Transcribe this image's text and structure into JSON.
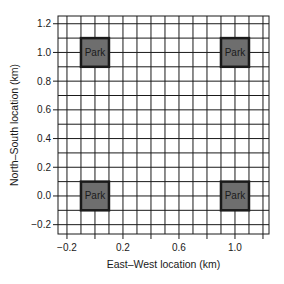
{
  "chart_data": {
    "type": "scatter",
    "title": "",
    "xlabel": "East–West location (km)",
    "ylabel": "North–South location (km)",
    "xlim": [
      -0.264,
      1.243
    ],
    "ylim": [
      -0.265,
      1.254
    ],
    "x_ticks": [
      -0.2,
      0.0,
      0.2,
      0.4,
      0.6,
      0.8,
      1.0,
      1.2
    ],
    "x_tick_labels": [
      "-0.2",
      "",
      "0.2",
      "",
      "0.6",
      "",
      "1.0",
      ""
    ],
    "y_ticks": [
      -0.2,
      0.0,
      0.2,
      0.4,
      0.6,
      0.8,
      1.0,
      1.2
    ],
    "y_tick_labels": [
      "-0.2",
      "0.0",
      "0.2",
      "0.4",
      "0.6",
      "0.8",
      "1.0",
      "1.2"
    ],
    "grid": {
      "on": true,
      "spacing_km": 0.1,
      "color": "#1a1a1a"
    },
    "legend": null,
    "parks": [
      {
        "label": "Park",
        "x": 0.0,
        "y": 1.0,
        "half_size_km": 0.1
      },
      {
        "label": "Park",
        "x": 1.0,
        "y": 1.0,
        "half_size_km": 0.1
      },
      {
        "label": "Park",
        "x": 0.0,
        "y": 0.0,
        "half_size_km": 0.1
      },
      {
        "label": "Park",
        "x": 1.0,
        "y": 0.0,
        "half_size_km": 0.1
      }
    ],
    "colors": {
      "park_fill": "#6e6e6e",
      "park_border": "#1a1a1a",
      "grid": "#1a1a1a",
      "background": "#ffffff"
    }
  }
}
